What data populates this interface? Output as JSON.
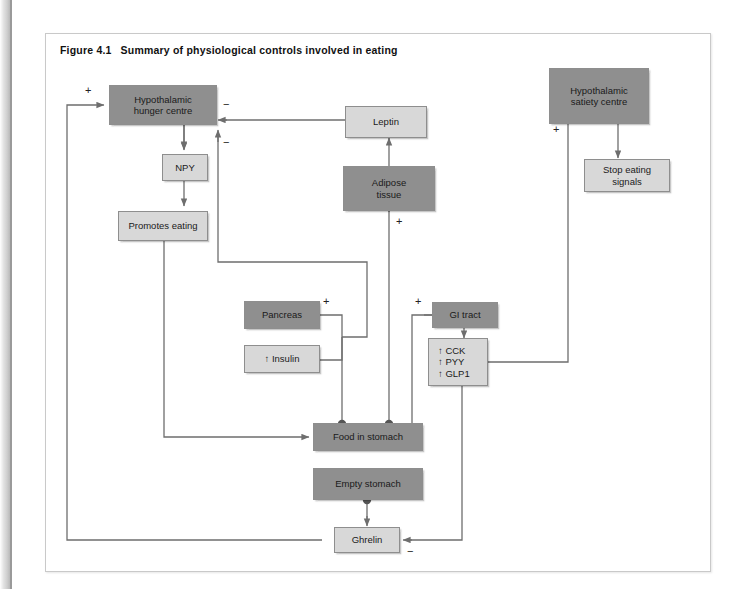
{
  "figure": {
    "number": "Figure 4.1",
    "caption": "Summary of physiological controls involved in eating"
  },
  "colors": {
    "dark_box": "#8f8f8f",
    "light_box": "#d8d8d8",
    "box_border": "#8e8e8e",
    "wire": "#6e6e6e",
    "page_background": "#ffffff"
  },
  "nodes": {
    "hypothalamic_hunger_centre": "Hypothalamic\nhunger centre",
    "npy": "NPY",
    "promotes_eating": "Promotes eating",
    "leptin": "Leptin",
    "adipose_tissue": "Adipose\ntissue",
    "hypothalamic_satiety_centre": "Hypothalamic\nsatiety centre",
    "stop_eating_signals": "Stop eating\nsignals",
    "pancreas": "Pancreas",
    "insulin": "↑ Insulin",
    "gi_tract": "GI tract",
    "gut_hormones": "↑ CCK\n↑ PYY\n↑ GLP1",
    "food_in_stomach": "Food in stomach",
    "empty_stomach": "Empty stomach",
    "ghrelin": "Ghrelin"
  },
  "signs": {
    "ghrelin_to_hunger_plus": "+",
    "leptin_to_hunger_minus": "−",
    "gut_hormones_to_hunger_minus": "−",
    "adipose_plus": "+",
    "pancreas_plus": "+",
    "gi_tract_plus": "+",
    "satiety_plus": "+",
    "ghrelin_minus": "−"
  },
  "edges": [
    {
      "from": "ghrelin",
      "to": "hypothalamic_hunger_centre",
      "sign": "+"
    },
    {
      "from": "hypothalamic_hunger_centre",
      "to": "npy",
      "sign": ""
    },
    {
      "from": "npy",
      "to": "promotes_eating",
      "sign": ""
    },
    {
      "from": "promotes_eating",
      "to": "food_in_stomach",
      "sign": ""
    },
    {
      "from": "leptin",
      "to": "hypothalamic_hunger_centre",
      "sign": "−"
    },
    {
      "from": "adipose_tissue",
      "to": "leptin",
      "sign": ""
    },
    {
      "from": "food_in_stomach",
      "to": "adipose_tissue",
      "sign": "+"
    },
    {
      "from": "pancreas",
      "to": "hypothalamic_hunger_centre",
      "sign": "−"
    },
    {
      "from": "insulin",
      "to": "hypothalamic_hunger_centre",
      "sign": "−"
    },
    {
      "from": "food_in_stomach",
      "to": "pancreas",
      "sign": "+"
    },
    {
      "from": "food_in_stomach",
      "to": "gi_tract",
      "sign": "+"
    },
    {
      "from": "gi_tract",
      "to": "gut_hormones",
      "sign": ""
    },
    {
      "from": "gut_hormones",
      "to": "hypothalamic_satiety_centre",
      "sign": "+"
    },
    {
      "from": "hypothalamic_satiety_centre",
      "to": "stop_eating_signals",
      "sign": ""
    },
    {
      "from": "gut_hormones",
      "to": "ghrelin",
      "sign": "−"
    },
    {
      "from": "empty_stomach",
      "to": "ghrelin",
      "sign": ""
    }
  ]
}
